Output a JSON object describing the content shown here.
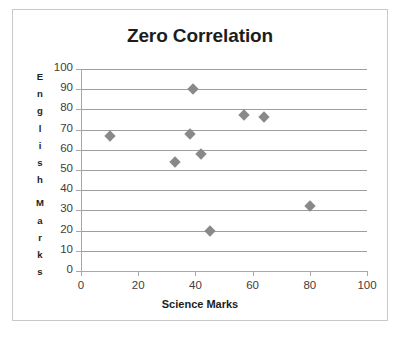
{
  "chart_data": {
    "type": "scatter",
    "title": "Zero Correlation",
    "xlabel": "Science  Marks",
    "ylabel": "English Marks",
    "ylabel_letters": [
      "E",
      "n",
      "g",
      "l",
      "i",
      "s",
      "h",
      "",
      "M",
      "a",
      "r",
      "k",
      "s"
    ],
    "xlim": [
      0,
      100
    ],
    "ylim": [
      0,
      100
    ],
    "xticks": [
      0,
      20,
      40,
      60,
      80,
      100
    ],
    "yticks": [
      0,
      10,
      20,
      30,
      40,
      50,
      60,
      70,
      80,
      90,
      100
    ],
    "xtick_labels": [
      "0",
      "20",
      "40",
      "60",
      "80",
      "100"
    ],
    "ytick_labels": [
      "0",
      "10",
      "20",
      "30",
      "40",
      "50",
      "60",
      "70",
      "80",
      "90",
      "100"
    ],
    "grid": "horizontal",
    "legend": "none",
    "marker": "diamond",
    "marker_color": "#898989",
    "gridline_color": "#9e9e9e",
    "axis_color": "#a8a8a8",
    "border_color": "#c9c9c9",
    "background": "#ffffff",
    "series": [
      {
        "name": "Students",
        "points": [
          {
            "x": 10,
            "y": 67
          },
          {
            "x": 33,
            "y": 54
          },
          {
            "x": 38,
            "y": 68
          },
          {
            "x": 39,
            "y": 90
          },
          {
            "x": 42,
            "y": 58
          },
          {
            "x": 45,
            "y": 20
          },
          {
            "x": 57,
            "y": 77
          },
          {
            "x": 64,
            "y": 76
          },
          {
            "x": 80,
            "y": 32
          }
        ]
      }
    ]
  }
}
